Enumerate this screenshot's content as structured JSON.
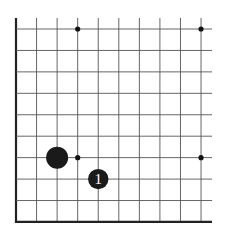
{
  "diagram": {
    "type": "go-board-fragment",
    "corner": "bottom-left",
    "columns_visible": 10,
    "rows_visible": 10,
    "colors": {
      "background": "#ffffff",
      "grid_line": "#555555",
      "edge_line": "#222222",
      "stone_black": "#1a1a1a",
      "move_number": "#ffffff",
      "star_point": "#111111"
    },
    "star_points": [
      {
        "col": 3,
        "row": 0
      },
      {
        "col": 9,
        "row": 0
      },
      {
        "col": 3,
        "row": 6
      },
      {
        "col": 9,
        "row": 6
      }
    ],
    "stones": [
      {
        "color": "black",
        "col": 2,
        "row": 6,
        "label": ""
      },
      {
        "color": "black",
        "col": 4,
        "row": 7,
        "label": "1"
      }
    ]
  }
}
